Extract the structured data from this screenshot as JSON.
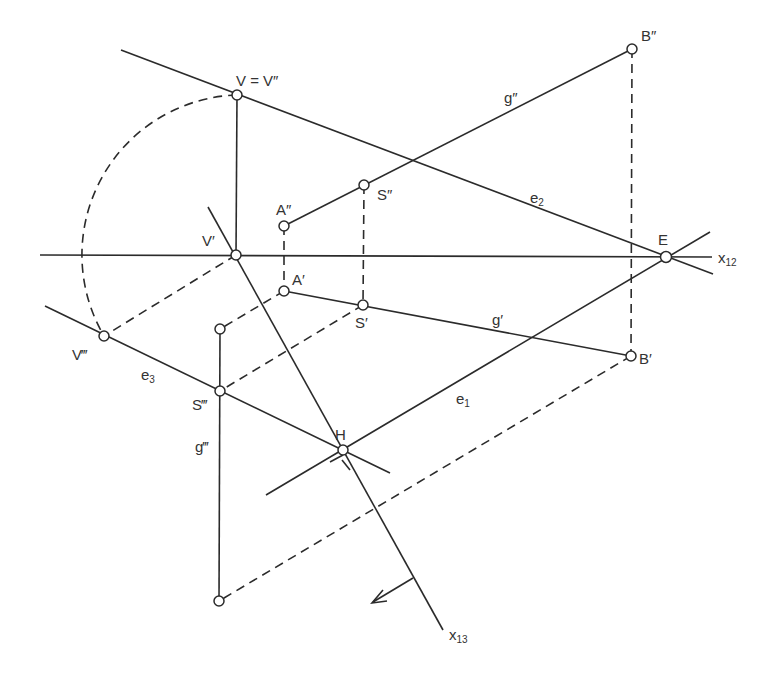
{
  "diagram": {
    "type": "descriptive-geometry-construction",
    "axes": [
      {
        "id": "x12",
        "label": "x",
        "subscript": "12"
      },
      {
        "id": "x13",
        "label": "x",
        "subscript": "13"
      }
    ],
    "points": [
      {
        "id": "V",
        "label": "V = V″",
        "x": 237,
        "y": 95
      },
      {
        "id": "V1",
        "label": "V′",
        "x": 236,
        "y": 255
      },
      {
        "id": "V3",
        "label": "V‴",
        "x": 104,
        "y": 336
      },
      {
        "id": "A2",
        "label": "A″",
        "x": 284,
        "y": 226
      },
      {
        "id": "A1",
        "label": "A′",
        "x": 284,
        "y": 291
      },
      {
        "id": "S2",
        "label": "S″",
        "x": 364,
        "y": 185
      },
      {
        "id": "S1",
        "label": "S′",
        "x": 363,
        "y": 305
      },
      {
        "id": "S3",
        "label": "S‴",
        "x": 220,
        "y": 391
      },
      {
        "id": "B2",
        "label": "B″",
        "x": 632,
        "y": 49
      },
      {
        "id": "B1",
        "label": "B′",
        "x": 631,
        "y": 356
      },
      {
        "id": "E",
        "label": "E",
        "x": 666,
        "y": 257
      },
      {
        "id": "H",
        "label": "H",
        "x": 343,
        "y": 450
      },
      {
        "id": "A3",
        "label": "",
        "x": 220,
        "y": 329
      },
      {
        "id": "B3",
        "label": "",
        "x": 219,
        "y": 601
      }
    ],
    "lines": [
      {
        "id": "g2",
        "label": "g″"
      },
      {
        "id": "g1",
        "label": "g′"
      },
      {
        "id": "g3",
        "label": "g‴"
      },
      {
        "id": "e1",
        "label": "e₁"
      },
      {
        "id": "e2",
        "label": "e₂"
      },
      {
        "id": "e3",
        "label": "e₃"
      }
    ],
    "labels": {
      "V": "V = V″",
      "V1": "V′",
      "V3": "V‴",
      "A2": "A″",
      "A1": "A′",
      "S2": "S″",
      "S1": "S′",
      "S3": "S‴",
      "B2": "B″",
      "B1": "B′",
      "E": "E",
      "H": "H",
      "g2": "g″",
      "g1": "g′",
      "g3": "g‴",
      "e1": "e",
      "e1_sub": "1",
      "e2": "e",
      "e2_sub": "2",
      "e3": "e",
      "e3_sub": "3",
      "x12": "x",
      "x12_sub": "12",
      "x13": "x",
      "x13_sub": "13"
    }
  }
}
